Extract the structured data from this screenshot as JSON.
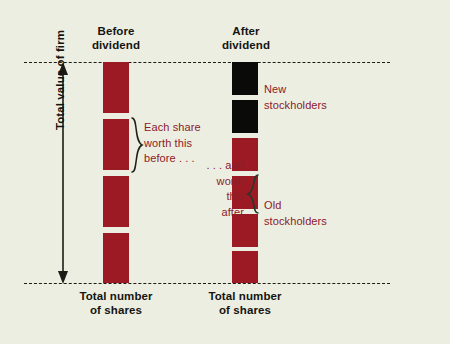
{
  "figure": {
    "background_color": "#edeee2",
    "bar_color_red": "#9c1a24",
    "bar_color_black": "#0a0a08",
    "annotation_color": "#8a2028",
    "line_color": "#1c1b16"
  },
  "axis": {
    "vertical_label": "Total value of firm"
  },
  "columns": [
    {
      "id": "before",
      "title": "Before\ndividend",
      "caption": "Total number\nof shares",
      "segments": [
        {
          "color": "red",
          "top": 62,
          "height": 51
        },
        {
          "color": "red",
          "top": 119,
          "height": 51
        },
        {
          "color": "red",
          "top": 176,
          "height": 51
        },
        {
          "color": "red",
          "top": 233,
          "height": 50
        }
      ]
    },
    {
      "id": "after",
      "title": "After\ndividend",
      "caption": "Total number\nof shares",
      "segments": [
        {
          "color": "black",
          "top": 62,
          "height": 33
        },
        {
          "color": "black",
          "top": 100,
          "height": 33
        },
        {
          "color": "red",
          "top": 138,
          "height": 33
        },
        {
          "color": "red",
          "top": 176,
          "height": 33
        },
        {
          "color": "red",
          "top": 214,
          "height": 33
        },
        {
          "color": "red",
          "top": 251,
          "height": 32
        }
      ]
    }
  ],
  "annotations": {
    "before_share": "Each share\nworth this\nbefore . . .",
    "after_share": ". . . and\nworth\nthis\nafter",
    "new_stockholders": "New\nstockholders",
    "old_stockholders": "Old\nstockholders"
  },
  "chart_data": {
    "type": "bar",
    "title": "",
    "xlabel": "Total number of shares",
    "ylabel": "Total value of firm",
    "categories": [
      "Before dividend",
      "After dividend"
    ],
    "series": [
      {
        "name": "Old stockholders (shares)",
        "values": [
          4,
          4
        ]
      },
      {
        "name": "New stockholders (shares)",
        "values": [
          0,
          2
        ]
      }
    ],
    "shares_before": 4,
    "shares_after": 6,
    "share_value_before": 0.25,
    "share_value_after": 0.1667,
    "total_firm_value": 1.0,
    "grid": false,
    "legend": "inline-annotations"
  }
}
